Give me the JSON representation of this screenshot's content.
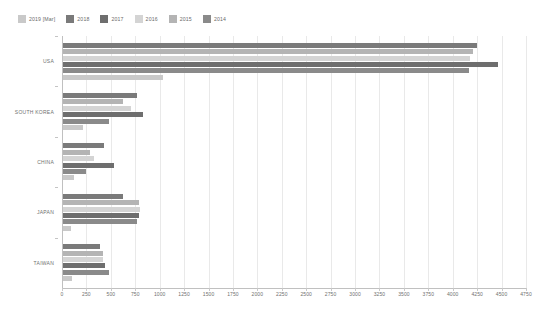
{
  "chart_data": {
    "type": "bar",
    "orientation": "horizontal",
    "title": "",
    "subtitle": "",
    "xlabel": "",
    "ylabel": "",
    "categories": [
      "USA",
      "SOUTH KOREA",
      "CHINA",
      "JAPAN",
      "TAIWAN"
    ],
    "xlim": [
      0,
      4750
    ],
    "xticks": [
      0,
      250,
      500,
      750,
      1000,
      1250,
      1500,
      1750,
      2000,
      2250,
      2500,
      2750,
      3000,
      3250,
      3500,
      3750,
      4000,
      4250,
      4500,
      4750
    ],
    "xtick_labels": [
      "0",
      "250",
      "500",
      "750",
      "1000",
      "1250",
      "1500",
      "1750",
      "2000",
      "2250",
      "2500",
      "2750",
      "3000",
      "3250",
      "3500",
      "3750",
      "4000",
      "4250",
      "4500",
      "4750"
    ],
    "grid": true,
    "grid_axis": "x",
    "legend_position": "top-left",
    "series": [
      {
        "name": "2019 [Mar]",
        "color": "#c9c9c9",
        "values": [
          1030,
          215,
          120,
          90,
          105
        ]
      },
      {
        "name": "2018",
        "color": "#7a7a7a",
        "values": [
          4250,
          770,
          425,
          620,
          390
        ]
      },
      {
        "name": "2017",
        "color": "#6e6e6e",
        "values": [
          4460,
          830,
          530,
          790,
          440
        ]
      },
      {
        "name": "2016",
        "color": "#d4d4d4",
        "values": [
          4180,
          710,
          330,
          800,
          420
        ]
      },
      {
        "name": "2015",
        "color": "#b4b4b4",
        "values": [
          4210,
          620,
          290,
          790,
          420
        ]
      },
      {
        "name": "2014",
        "color": "#8a8a8a",
        "values": [
          4170,
          480,
          250,
          770,
          480
        ]
      }
    ],
    "series_draw_order": [
      "2018",
      "2015",
      "2016",
      "2017",
      "2014",
      "2019 [Mar]"
    ]
  },
  "legend": {
    "items": [
      {
        "label": "2019 [Mar]",
        "color": "#c9c9c9"
      },
      {
        "label": "2018",
        "color": "#7a7a7a"
      },
      {
        "label": "2017",
        "color": "#6e6e6e"
      },
      {
        "label": "2016",
        "color": "#d4d4d4"
      },
      {
        "label": "2015",
        "color": "#b4b4b4"
      },
      {
        "label": "2014",
        "color": "#8a8a8a"
      }
    ]
  }
}
